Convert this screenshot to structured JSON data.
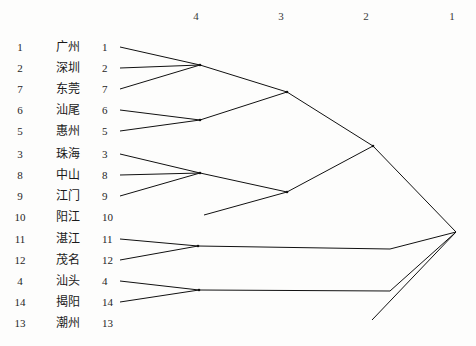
{
  "figure": {
    "type": "dendrogram",
    "orientation": "horizontal-right-to-left",
    "scale_headers": [
      {
        "label": "4",
        "x": 196
      },
      {
        "label": "3",
        "x": 281
      },
      {
        "label": "2",
        "x": 366
      },
      {
        "label": "1",
        "x": 452
      }
    ]
  },
  "leaves": [
    {
      "rank": "1",
      "name": "广州",
      "id": "1",
      "y": 47
    },
    {
      "rank": "2",
      "name": "深圳",
      "id": "2",
      "y": 68
    },
    {
      "rank": "7",
      "name": "东莞",
      "id": "7",
      "y": 89
    },
    {
      "rank": "6",
      "name": "汕尾",
      "id": "6",
      "y": 110
    },
    {
      "rank": "5",
      "name": "惠州",
      "id": "5",
      "y": 131
    },
    {
      "rank": "3",
      "name": "珠海",
      "id": "3",
      "y": 154
    },
    {
      "rank": "8",
      "name": "中山",
      "id": "8",
      "y": 175
    },
    {
      "rank": "9",
      "name": "江门",
      "id": "9",
      "y": 196
    },
    {
      "rank": "10",
      "name": "阳江",
      "id": "10",
      "y": 217
    },
    {
      "rank": "11",
      "name": "湛江",
      "id": "11",
      "y": 239
    },
    {
      "rank": "12",
      "name": "茂名",
      "id": "12",
      "y": 260
    },
    {
      "rank": "4",
      "name": "汕头",
      "id": "4",
      "y": 281
    },
    {
      "rank": "14",
      "name": "揭阳",
      "id": "14",
      "y": 302
    },
    {
      "rank": "13",
      "name": "潮州",
      "id": "13",
      "y": 323
    }
  ],
  "chart_data": {
    "type": "tree",
    "title": "",
    "xlabel": "",
    "ylabel": "",
    "axis_ticks": [
      "4",
      "3",
      "2",
      "1"
    ],
    "axis_tick_x": [
      196,
      281,
      366,
      452
    ],
    "leaf_labels": [
      "广州",
      "深圳",
      "东莞",
      "汕尾",
      "惠州",
      "珠海",
      "中山",
      "江门",
      "阳江",
      "湛江",
      "茂名",
      "汕头",
      "揭阳",
      "潮州"
    ],
    "leaf_ids": [
      "1",
      "2",
      "7",
      "6",
      "5",
      "3",
      "8",
      "9",
      "10",
      "11",
      "12",
      "4",
      "14",
      "13"
    ],
    "clusters": [
      {
        "name": "cluster-1-2-7",
        "members": [
          "1",
          "2",
          "7"
        ],
        "merge_x": 200,
        "merge_y": 65
      },
      {
        "name": "cluster-6-5",
        "members": [
          "6",
          "5"
        ],
        "merge_x": 200,
        "merge_y": 120
      },
      {
        "name": "cluster-upper",
        "members": [
          "1",
          "2",
          "7",
          "6",
          "5"
        ],
        "merge_x": 287,
        "merge_y": 92
      },
      {
        "name": "cluster-3-8-9",
        "members": [
          "3",
          "8",
          "9"
        ],
        "merge_x": 200,
        "merge_y": 173
      },
      {
        "name": "cluster-3-8-9-10",
        "members": [
          "3",
          "8",
          "9",
          "10"
        ],
        "merge_x": 287,
        "merge_y": 192
      },
      {
        "name": "cluster-pearl",
        "members": [
          "1",
          "2",
          "7",
          "6",
          "5",
          "3",
          "8",
          "9",
          "10"
        ],
        "merge_x": 373,
        "merge_y": 146
      },
      {
        "name": "cluster-11-12",
        "members": [
          "11",
          "12"
        ],
        "merge_x": 198,
        "merge_y": 246
      },
      {
        "name": "cluster-4-14",
        "members": [
          "4",
          "14"
        ],
        "merge_x": 199,
        "merge_y": 290
      },
      {
        "name": "root",
        "members": [
          "all"
        ],
        "merge_x": 456,
        "merge_y": 232
      }
    ],
    "edges": [
      {
        "from": "leaf-1",
        "points": "120,47 200,65"
      },
      {
        "from": "leaf-2",
        "points": "120,68 200,65"
      },
      {
        "from": "leaf-7",
        "points": "120,89 200,65"
      },
      {
        "from": "leaf-6",
        "points": "120,110 200,120"
      },
      {
        "from": "leaf-5",
        "points": "120,131 200,120"
      },
      {
        "from": "node-127",
        "points": "200,65 287,92"
      },
      {
        "from": "node-65",
        "points": "200,120 287,92"
      },
      {
        "from": "leaf-3",
        "points": "120,154 200,173"
      },
      {
        "from": "leaf-8",
        "points": "120,175 200,173"
      },
      {
        "from": "leaf-9",
        "points": "120,196 200,173"
      },
      {
        "from": "node-389",
        "points": "200,173 287,192"
      },
      {
        "from": "leaf-10",
        "points": "204,215 287,192"
      },
      {
        "from": "node-up",
        "points": "287,92 373,146"
      },
      {
        "from": "node-mid",
        "points": "287,192 373,146"
      },
      {
        "from": "node-pearl",
        "points": "373,146 456,232"
      },
      {
        "from": "leaf-11",
        "points": "120,239 198,246"
      },
      {
        "from": "leaf-12",
        "points": "120,260 198,246"
      },
      {
        "from": "node-1112",
        "points": "198,246 390,249 456,232"
      },
      {
        "from": "leaf-4",
        "points": "120,281 199,290"
      },
      {
        "from": "leaf-14",
        "points": "120,302 199,290"
      },
      {
        "from": "node-414",
        "points": "199,290 390,291 456,232"
      },
      {
        "from": "leaf-13-stub",
        "points": "372,320 456,232"
      }
    ]
  }
}
